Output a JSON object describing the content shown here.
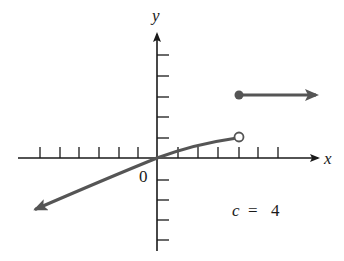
{
  "graph": {
    "type": "piecewise-function-graph",
    "axis_labels": {
      "x": "x",
      "y": "y"
    },
    "origin_label": "0",
    "annotation": "c = 4",
    "annotation_parts": {
      "var": "c",
      "eq": "=",
      "value": "4"
    },
    "colors": {
      "axis": "#1a1a1a",
      "curve": "#555555",
      "background": "#ffffff"
    },
    "x_ticks": [
      -6,
      -5,
      -4,
      -3,
      -2,
      -1,
      1,
      2,
      3,
      4,
      5,
      6
    ],
    "y_ticks": [
      -4,
      -3,
      -2,
      -1,
      1,
      2,
      3,
      4,
      5
    ],
    "pieces": [
      {
        "description": "increasing concave-down curve through origin, arrow to lower-left",
        "x_range": [
          "-inf",
          4
        ],
        "through": [
          [
            -6,
            -2.6
          ],
          [
            0,
            0
          ],
          [
            4,
            1
          ]
        ],
        "left_end": "arrow",
        "right_end": "open-circle"
      },
      {
        "description": "horizontal ray",
        "y": 3,
        "x_range": [
          4,
          "+inf"
        ],
        "left_end": "closed-dot",
        "right_end": "arrow"
      }
    ],
    "discontinuity_at": 4
  }
}
